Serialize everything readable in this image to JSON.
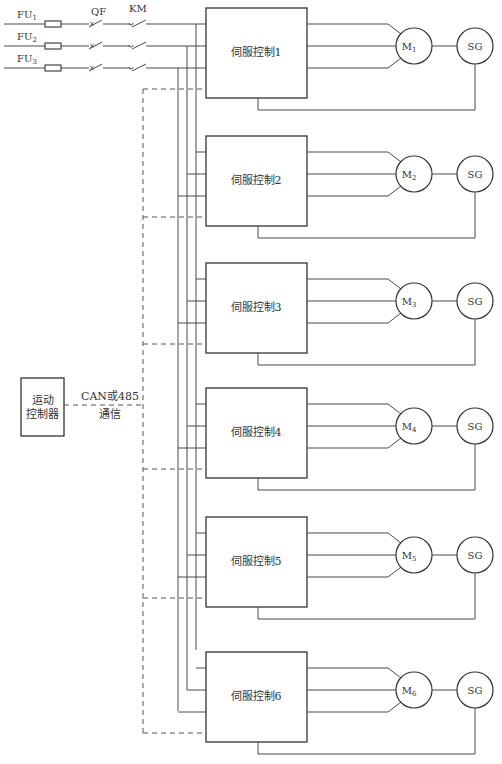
{
  "diagram": {
    "supply": {
      "phases": [
        {
          "fuse_label": "FU",
          "fuse_sub": "1",
          "y": 24,
          "bus_x": 196
        },
        {
          "fuse_label": "FU",
          "fuse_sub": "2",
          "y": 46,
          "bus_x": 187
        },
        {
          "fuse_label": "FU",
          "fuse_sub": "3",
          "y": 68,
          "bus_x": 178
        }
      ],
      "breaker_label": "QF",
      "contactor_label": "KM"
    },
    "controller": {
      "line1": "运动",
      "line2": "控制器"
    },
    "bus": {
      "label_line1": "CAN或485",
      "label_line2": "通信"
    },
    "servos": [
      {
        "label": "伺服控制1",
        "top": 8,
        "motor": "M",
        "motor_sub": "1",
        "encoder": "SG"
      },
      {
        "label": "伺服控制2",
        "top": 136,
        "motor": "M",
        "motor_sub": "2",
        "encoder": "SG"
      },
      {
        "label": "伺服控制3",
        "top": 263,
        "motor": "M",
        "motor_sub": "3",
        "encoder": "SG"
      },
      {
        "label": "伺服控制4",
        "top": 388,
        "motor": "M",
        "motor_sub": "4",
        "encoder": "SG"
      },
      {
        "label": "伺服控制5",
        "top": 517,
        "motor": "M",
        "motor_sub": "5",
        "encoder": "SG"
      },
      {
        "label": "伺服控制6",
        "top": 652,
        "motor": "M",
        "motor_sub": "6",
        "encoder": "SG"
      }
    ],
    "colors": {
      "line": "#4a4a4a",
      "box": "#333333",
      "background": "#ffffff"
    }
  }
}
